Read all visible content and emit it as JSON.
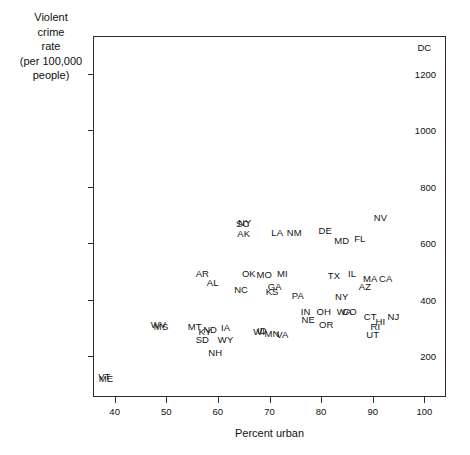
{
  "chart_data": {
    "type": "scatter",
    "title": "",
    "xlabel": "Percent urban",
    "ylabel": "Violent\ncrime\nrate\n(per 100,000\npeople)",
    "xlim": [
      36,
      104
    ],
    "ylim": [
      60,
      1330
    ],
    "xticks": [
      40,
      50,
      60,
      70,
      80,
      90,
      100
    ],
    "yticks": [
      200,
      400,
      600,
      800,
      1000,
      1200
    ],
    "grid": false,
    "legend": null,
    "point_label_mode": "state-abbreviation",
    "points": [
      {
        "label": "DC",
        "x": 100.0,
        "y": 1290
      },
      {
        "label": "NV",
        "x": 91.5,
        "y": 690
      },
      {
        "label": "SC",
        "x": 64.8,
        "y": 670
      },
      {
        "label": "NY",
        "x": 65.2,
        "y": 673
      },
      {
        "label": "AK",
        "x": 65.0,
        "y": 633
      },
      {
        "label": "LA",
        "x": 71.5,
        "y": 638
      },
      {
        "label": "NM",
        "x": 74.8,
        "y": 638
      },
      {
        "label": "DE",
        "x": 80.8,
        "y": 645
      },
      {
        "label": "MD",
        "x": 84.0,
        "y": 610
      },
      {
        "label": "FL",
        "x": 87.5,
        "y": 614
      },
      {
        "label": "AR",
        "x": 57.0,
        "y": 492
      },
      {
        "label": "OK",
        "x": 66.0,
        "y": 492
      },
      {
        "label": "MO",
        "x": 69.0,
        "y": 487
      },
      {
        "label": "MI",
        "x": 72.5,
        "y": 490
      },
      {
        "label": "TX",
        "x": 82.5,
        "y": 486
      },
      {
        "label": "IL",
        "x": 86.0,
        "y": 490
      },
      {
        "label": "MA",
        "x": 89.5,
        "y": 473
      },
      {
        "label": "CA",
        "x": 92.5,
        "y": 475
      },
      {
        "label": "AL",
        "x": 59.0,
        "y": 460
      },
      {
        "label": "AZ",
        "x": 88.5,
        "y": 446
      },
      {
        "label": "NC",
        "x": 64.5,
        "y": 434
      },
      {
        "label": "KS",
        "x": 70.5,
        "y": 429
      },
      {
        "label": "GA",
        "x": 71.0,
        "y": 444
      },
      {
        "label": "PA",
        "x": 75.5,
        "y": 412
      },
      {
        "label": "NY",
        "x": 84.0,
        "y": 410
      },
      {
        "label": "IN",
        "x": 77.0,
        "y": 356
      },
      {
        "label": "OH",
        "x": 80.5,
        "y": 356
      },
      {
        "label": "WA",
        "x": 84.5,
        "y": 358
      },
      {
        "label": "CO",
        "x": 85.5,
        "y": 358
      },
      {
        "label": "CT",
        "x": 89.5,
        "y": 340
      },
      {
        "label": "NJ",
        "x": 94.0,
        "y": 338
      },
      {
        "label": "NE",
        "x": 77.5,
        "y": 330
      },
      {
        "label": "OR",
        "x": 81.0,
        "y": 310
      },
      {
        "label": "HI",
        "x": 91.5,
        "y": 322
      },
      {
        "label": "RI",
        "x": 90.5,
        "y": 305
      },
      {
        "label": "WV",
        "x": 48.5,
        "y": 312
      },
      {
        "label": "MS",
        "x": 49.0,
        "y": 303
      },
      {
        "label": "MT",
        "x": 55.5,
        "y": 305
      },
      {
        "label": "IA",
        "x": 61.5,
        "y": 300
      },
      {
        "label": "KY",
        "x": 57.5,
        "y": 288
      },
      {
        "label": "ND",
        "x": 58.5,
        "y": 292
      },
      {
        "label": "WI",
        "x": 68.0,
        "y": 287
      },
      {
        "label": "ID",
        "x": 68.5,
        "y": 290
      },
      {
        "label": "MN",
        "x": 70.5,
        "y": 281
      },
      {
        "label": "VA",
        "x": 72.5,
        "y": 275
      },
      {
        "label": "UT",
        "x": 90.0,
        "y": 276
      },
      {
        "label": "SD",
        "x": 57.0,
        "y": 257
      },
      {
        "label": "WY",
        "x": 61.5,
        "y": 257
      },
      {
        "label": "NH",
        "x": 59.5,
        "y": 212
      },
      {
        "label": "VT",
        "x": 38.0,
        "y": 128
      },
      {
        "label": "ME",
        "x": 38.3,
        "y": 120
      }
    ]
  }
}
